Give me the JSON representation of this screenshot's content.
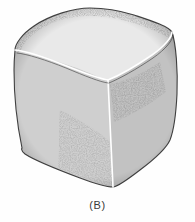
{
  "figure": {
    "caption": "(B)",
    "background_color": "#fefefe",
    "ink_color": "#2b2b2b",
    "caption_color": "#3a3a3a",
    "view": "three-quarter view showing top face, left-front face and right-front face",
    "faces": [
      {
        "name": "top-face",
        "shading": "lightest, bright center with darkened rounded edges",
        "stipple_density_percent": 22,
        "tone_hex": "#d8d8d8"
      },
      {
        "name": "left-front-face",
        "shading": "medium mid-grey, lighter toward the left silhouette",
        "stipple_density_percent": 46,
        "tone_hex": "#a8a8a8"
      },
      {
        "name": "right-front-face",
        "shading": "darkest, dense stipple falling off to the right edge",
        "stipple_density_percent": 58,
        "tone_hex": "#8f8f8f"
      }
    ],
    "highlight_edges": [
      {
        "name": "top-left-edge-highlight",
        "color": "#ffffff"
      },
      {
        "name": "top-right-edge-highlight",
        "color": "#ffffff"
      },
      {
        "name": "vertical-front-edge-highlight",
        "color": "#ffffff"
      }
    ],
    "vertices": {
      "top_back": {
        "x": 90,
        "y": 8
      },
      "left_top": {
        "x": 15,
        "y": 50
      },
      "right_top": {
        "x": 172,
        "y": 32
      },
      "front_top": {
        "x": 108,
        "y": 80
      },
      "left_bottom": {
        "x": 22,
        "y": 148
      },
      "front_bottom": {
        "x": 113,
        "y": 187
      },
      "right_bottom": {
        "x": 170,
        "y": 140
      }
    }
  }
}
